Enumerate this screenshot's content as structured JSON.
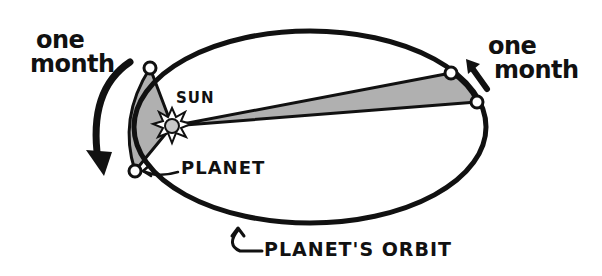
{
  "diagram": {
    "labels": {
      "left_period_line1": "one",
      "left_period_line2": "month",
      "right_period_line1": "one",
      "right_period_line2": "month",
      "sun": "SUN",
      "planet": "PLANET",
      "orbit": "PLANET'S ORBIT"
    },
    "colors": {
      "stroke": "#111111",
      "sector_fill": "#b0b0b0",
      "sun_fill": "#c8c8c8",
      "background": "#ffffff"
    },
    "geometry": {
      "orbit_center": [
        310,
        127
      ],
      "orbit_rx": 176,
      "orbit_ry": 96,
      "sun": [
        172,
        126
      ],
      "left_sector_points": [
        [
          150,
          68
        ],
        [
          135,
          171
        ]
      ],
      "right_sector_points": [
        [
          451,
          73
        ],
        [
          477,
          102
        ]
      ]
    }
  }
}
